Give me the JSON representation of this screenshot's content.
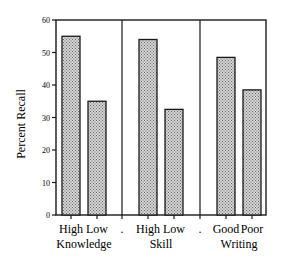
{
  "chart_data": {
    "type": "bar",
    "title": "",
    "xlabel": "",
    "ylabel": "Percent Recall",
    "ylim": [
      0,
      60
    ],
    "yticks": [
      0,
      10,
      20,
      30,
      40,
      50,
      60
    ],
    "grid": false,
    "legend": null,
    "groups": [
      {
        "name": "Knowledge",
        "categories": [
          "High",
          "Low"
        ],
        "values": [
          55,
          35
        ]
      },
      {
        "name": "Skill",
        "categories": [
          "High",
          "Low"
        ],
        "values": [
          54,
          32.5
        ]
      },
      {
        "name": "Writing",
        "categories": [
          "Good",
          "Poor"
        ],
        "values": [
          48.5,
          38.5
        ]
      }
    ],
    "categories": [
      "High Knowledge",
      "Low Knowledge",
      "High Skill",
      "Low Skill",
      "Good Writing",
      "Poor Writing"
    ],
    "values": [
      55,
      35,
      54,
      32.5,
      48.5,
      38.5
    ],
    "separator_label": ".",
    "bar_fill": "stippled gray",
    "colors": {
      "bar_fill": "#c8c8c8",
      "bar_dots": "#6a6a6a",
      "stroke": "#1a1a1a"
    }
  }
}
